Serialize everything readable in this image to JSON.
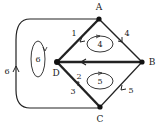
{
  "diagram": {
    "type": "planar-graph",
    "nodes": [
      {
        "id": "A",
        "label": "A",
        "x": 99,
        "y": 19,
        "lx": 99,
        "ly": 10
      },
      {
        "id": "B",
        "label": "B",
        "x": 142,
        "y": 62,
        "lx": 152,
        "ly": 65
      },
      {
        "id": "C",
        "label": "C",
        "x": 100,
        "y": 107,
        "lx": 100,
        "ly": 122
      },
      {
        "id": "D",
        "label": "D",
        "x": 57,
        "y": 62,
        "lx": 56,
        "ly": 76
      }
    ],
    "edges": [
      {
        "id": "e1",
        "from": "A",
        "to": "D",
        "label": "1",
        "lx": 74,
        "ly": 36
      },
      {
        "id": "e4",
        "from": "A",
        "to": "B",
        "label": "4",
        "lx": 127,
        "ly": 36
      },
      {
        "id": "e-BD",
        "from": "B",
        "to": "D",
        "label": "",
        "bold": true
      },
      {
        "id": "e2",
        "from": "D",
        "to": "C",
        "label": "2",
        "lx": 79,
        "ly": 79
      },
      {
        "id": "e3",
        "from": "D",
        "to": "C",
        "label": "3",
        "lx": 73,
        "ly": 94
      },
      {
        "id": "e5",
        "from": "B",
        "to": "C",
        "label": "5",
        "lx": 131,
        "ly": 93
      },
      {
        "id": "e6",
        "from": "A",
        "to": "C",
        "label": "6",
        "lx": 7,
        "ly": 74,
        "outer_loop": true
      }
    ],
    "faces": [
      {
        "id": "f4",
        "label": "4",
        "cx": 100,
        "cy": 44,
        "rx": 13,
        "ry": 8
      },
      {
        "id": "f5",
        "label": "5",
        "cx": 100,
        "cy": 81,
        "rx": 13,
        "ry": 8
      },
      {
        "id": "f6",
        "label": "6",
        "cx": 38,
        "cy": 59,
        "rx": 7,
        "ry": 18
      }
    ]
  }
}
